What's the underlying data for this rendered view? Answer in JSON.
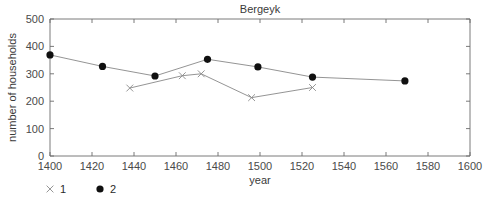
{
  "chart_data": {
    "type": "line",
    "title": "Bergeyk",
    "xlabel": "year",
    "ylabel": "number of households",
    "xlim": [
      1400,
      1600
    ],
    "ylim": [
      0,
      500
    ],
    "xticks": [
      1400,
      1420,
      1440,
      1460,
      1480,
      1500,
      1520,
      1540,
      1560,
      1580,
      1600
    ],
    "yticks": [
      0,
      100,
      200,
      300,
      400,
      500
    ],
    "xtick_labels": [
      "1400",
      "1420",
      "1440",
      "1460",
      "1480",
      "1500",
      "1520",
      "1540",
      "1560",
      "1580",
      "1600"
    ],
    "ytick_labels": [
      "0",
      "100",
      "200",
      "300",
      "400",
      "500"
    ],
    "grid": false,
    "legend_position": "below-left",
    "series": [
      {
        "name": "1",
        "marker": "cross",
        "marker_color": "#8a8a8a",
        "line_color": "#787878",
        "points": [
          {
            "x": 1438,
            "y": 248
          },
          {
            "x": 1463,
            "y": 293
          },
          {
            "x": 1472,
            "y": 300
          },
          {
            "x": 1496,
            "y": 213
          },
          {
            "x": 1525,
            "y": 250
          }
        ]
      },
      {
        "name": "2",
        "marker": "circle",
        "marker_color": "#101010",
        "line_color": "#787878",
        "points": [
          {
            "x": 1400,
            "y": 369
          },
          {
            "x": 1425,
            "y": 327
          },
          {
            "x": 1450,
            "y": 292
          },
          {
            "x": 1475,
            "y": 353
          },
          {
            "x": 1499,
            "y": 325
          },
          {
            "x": 1525,
            "y": 288
          },
          {
            "x": 1569,
            "y": 274
          }
        ]
      }
    ],
    "legend": [
      {
        "label": "1",
        "marker": "cross"
      },
      {
        "label": "2",
        "marker": "circle"
      }
    ]
  }
}
